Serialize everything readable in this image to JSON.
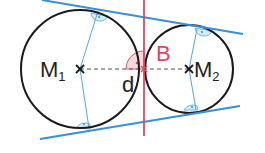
{
  "diagram": {
    "type": "two externally tangent circles with common tangents",
    "colors": {
      "circle": "#1a1a1a",
      "tangent": "#3a8fdc",
      "radius": "#5aa6e0",
      "right_angle_fill": "#d6ecfa",
      "common_tangent_at_B": "#e0475f",
      "right_angle_B_fill": "#f9d9de",
      "centerline": "#555555"
    },
    "labels": {
      "center1_main": "M",
      "center1_sub": "1",
      "center2_main": "M",
      "center2_sub": "2",
      "touch_point": "B",
      "distance": "d"
    },
    "circles": [
      {
        "name": "circle-1",
        "cx": 80,
        "cy": 69,
        "r": 59
      },
      {
        "name": "circle-2",
        "cx": 189,
        "cy": 69,
        "r": 44
      }
    ],
    "lines": {
      "top_tangent": {
        "x1": 42,
        "y1": 0,
        "x2": 243,
        "y2": 34
      },
      "bottom_tangent": {
        "x1": 40,
        "y1": 139,
        "x2": 240,
        "y2": 106
      },
      "red_tangent_at_B": {
        "x1": 144,
        "y1": 0,
        "x2": 144,
        "y2": 136
      },
      "center_line_dashed": {
        "x1": 80,
        "y1": 69,
        "x2": 189,
        "y2": 69
      }
    }
  }
}
